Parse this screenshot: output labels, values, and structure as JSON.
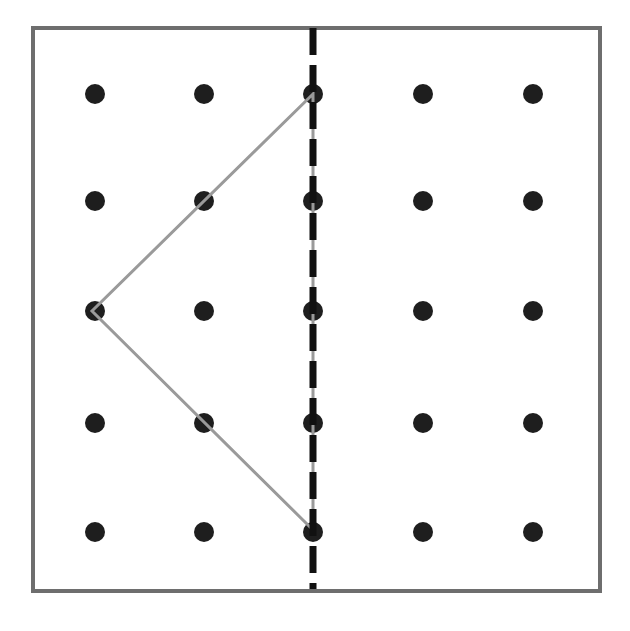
{
  "diagram": {
    "canvas": {
      "width": 630,
      "height": 631
    },
    "frame": {
      "x": 33,
      "y": 28,
      "width": 567,
      "height": 563,
      "stroke": "#6e6e6e",
      "stroke_width": 4
    },
    "grid": {
      "rows": 5,
      "cols": 5,
      "x_positions": [
        95,
        204,
        313,
        423,
        533
      ],
      "y_positions": [
        94,
        201,
        311,
        423,
        532
      ],
      "dot_radius": 10,
      "dot_color": "#1e1e1e"
    },
    "mirror_line": {
      "x": 313,
      "y1": 28,
      "y2": 589,
      "stroke": "#111111",
      "stroke_width": 7,
      "dash": [
        27,
        10
      ],
      "style": "dashed"
    },
    "shape": {
      "type": "triangle",
      "stroke": "#9a9a9a",
      "stroke_width": 3,
      "vertices_grid": [
        [
          2,
          0
        ],
        [
          0,
          2
        ],
        [
          2,
          4
        ]
      ],
      "vertices_px": [
        [
          313,
          94
        ],
        [
          92,
          311
        ],
        [
          313,
          530
        ]
      ]
    }
  }
}
